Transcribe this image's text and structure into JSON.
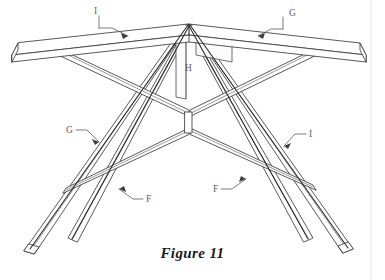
{
  "figure": {
    "caption": "Figure 11",
    "background_color": "#ffffff",
    "line_color": "#3a3a3c",
    "page_edge_color": "#e2e2e4"
  },
  "reference_labels": [
    {
      "id": "top-left",
      "text": "I",
      "x": 100,
      "y": 21,
      "leader_from": [
        106,
        24
      ],
      "leader_to": [
        128,
        33
      ],
      "bracket": true
    },
    {
      "id": "top-right",
      "text": "G",
      "x": 291,
      "y": 22,
      "leader_from": [
        288,
        25
      ],
      "leader_to": [
        270,
        34
      ],
      "bracket": true
    },
    {
      "id": "middle-left",
      "text": "G",
      "x": 68,
      "y": 133,
      "leader_from": [
        76,
        131
      ],
      "leader_to": [
        97,
        142
      ],
      "bracket": true
    },
    {
      "id": "middle-right",
      "text": "I",
      "x": 310,
      "y": 137,
      "leader_from": [
        306,
        135
      ],
      "leader_to": [
        286,
        146
      ],
      "bracket": true
    },
    {
      "id": "center",
      "text": "H",
      "x": 186,
      "y": 71,
      "leader_from": null,
      "leader_to": null,
      "bracket": false
    },
    {
      "id": "bottom-left",
      "text": "F",
      "x": 148,
      "y": 202,
      "leader_from": [
        143,
        199
      ],
      "leader_to": [
        118,
        188
      ],
      "bracket": true
    },
    {
      "id": "bottom-right",
      "text": "F",
      "x": 216,
      "y": 192,
      "leader_from": [
        222,
        190
      ],
      "leader_to": [
        245,
        178
      ],
      "bracket": true
    }
  ],
  "parts_legend": {
    "F": "lower cross brace / stretcher",
    "G": "splayed leg",
    "H": "center post at apex",
    "I": "top rail / tabletop board"
  }
}
